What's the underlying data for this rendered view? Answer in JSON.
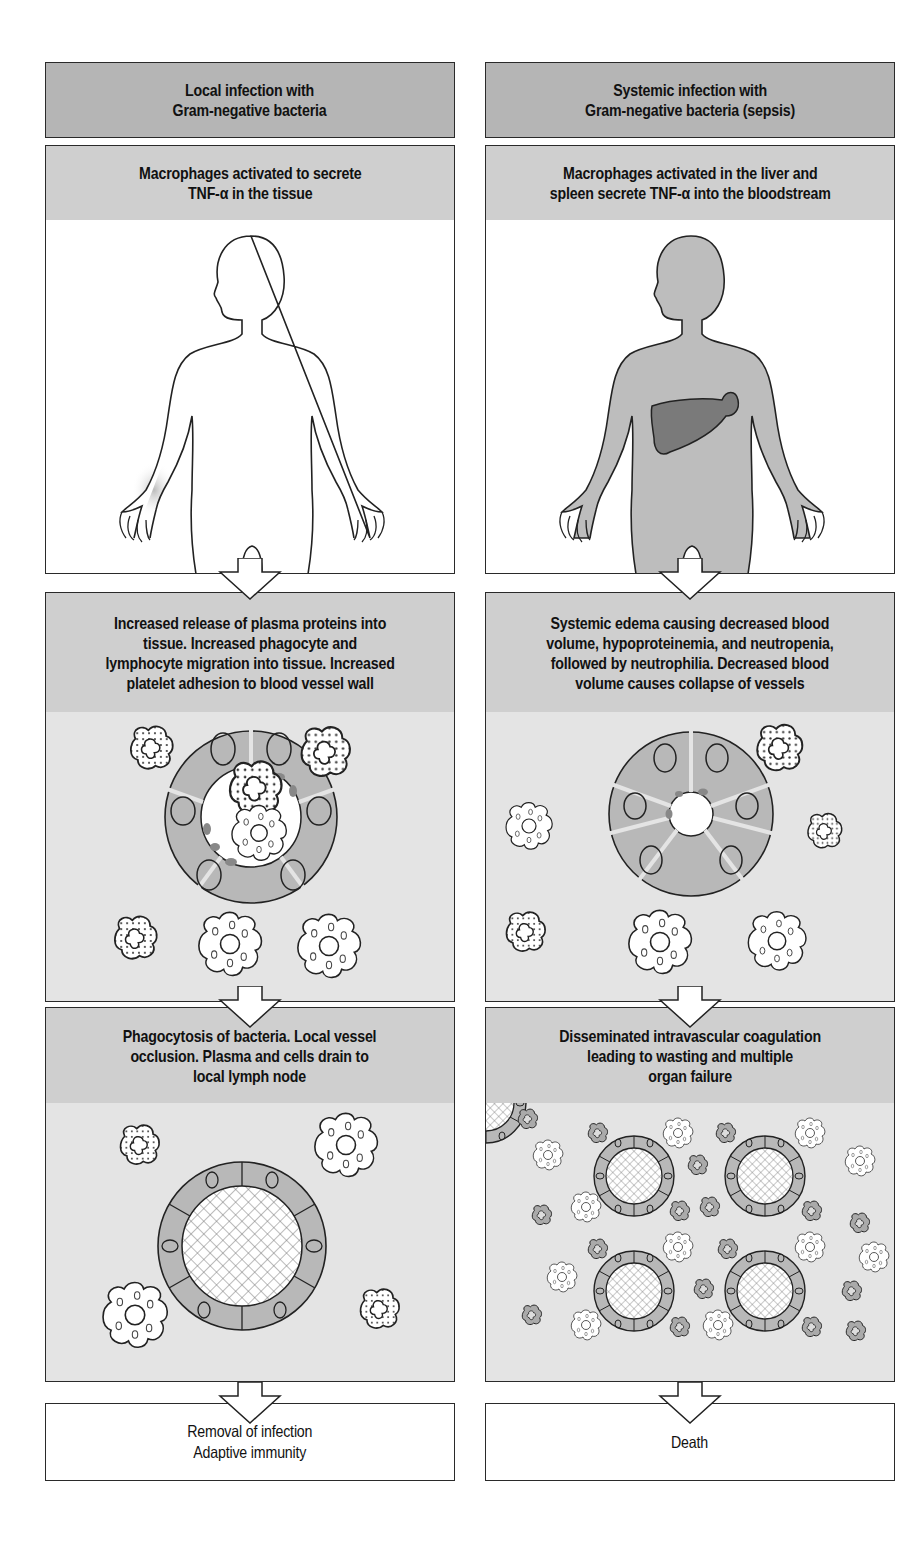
{
  "colors": {
    "header_fill": "#b5b5b5",
    "step_fill": "#cfcfcf",
    "illustration_fill": "#e4e4e4",
    "outline": "#2a2a2a",
    "liver": "#7a7a7a",
    "body_systemic": "#bdbdbd"
  },
  "left": {
    "header": "Local infection with\nGram-negative bacteria",
    "step1": "Macrophages activated to secrete\nTNF-α in the tissue",
    "step2": "Increased release of plasma proteins into\ntissue. Increased phagocyte and\nlymphocyte migration into tissue. Increased\nplatelet adhesion to blood vessel wall",
    "step3": "Phagocytosis of bacteria. Local vessel\nocclusion. Plasma and cells drain to\nlocal lymph node",
    "outcome": "Removal of infection\nAdaptive immunity"
  },
  "right": {
    "header": "Systemic infection with\nGram-negative bacteria (sepsis)",
    "step1": "Macrophages activated in the liver and\nspleen secrete TNF-α into the bloodstream",
    "step2": "Systemic edema causing decreased blood\nvolume, hypoproteinemia, and neutropenia,\nfollowed by neutrophilia. Decreased blood\nvolume causes collapse of vessels",
    "step3": "Disseminated intravascular coagulation\nleading to wasting and multiple\norgan failure",
    "outcome": "Death"
  },
  "illustrations": {
    "left_body": "human-silhouette-local-infection-hand",
    "right_body": "human-silhouette-shaded-with-liver",
    "left_vessel": "blood-vessel-with-migrating-phagocytes",
    "right_vessel": "collapsed-blood-vessel-with-phagocytes",
    "left_occlusion": "single-occluded-vessel",
    "right_occlusion": "four-occluded-vessels-disseminated"
  }
}
